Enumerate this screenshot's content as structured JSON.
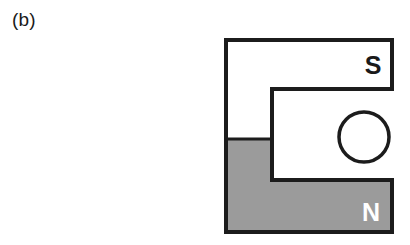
{
  "figure": {
    "panel_label": "(b)",
    "type": "horseshoe-magnet-cross-section",
    "colors": {
      "outline": "#1c1c1c",
      "north_pole_fill": "#9b9b9b",
      "south_pole_fill": "#ffffff",
      "background": "#ffffff",
      "south_label_color": "#1a1a1a",
      "north_label_color": "#ffffff"
    },
    "poles": [
      {
        "name": "south-pole",
        "label": "S",
        "fill": "white",
        "position": "upper-arm"
      },
      {
        "name": "north-pole",
        "label": "N",
        "fill": "gray",
        "position": "lower-arm"
      }
    ],
    "conductor": {
      "name": "wire-cross-section",
      "shape": "circle",
      "center_x": 364,
      "center_y": 137,
      "radius": 25,
      "fill": "white"
    },
    "geometry": {
      "outer_left": 226,
      "outer_top": 40,
      "outer_right": 392,
      "outer_bottom": 232,
      "upper_arm_bottom": 89,
      "notch_left": 272,
      "lower_arm_top": 180,
      "gray_top_left": 139
    }
  }
}
